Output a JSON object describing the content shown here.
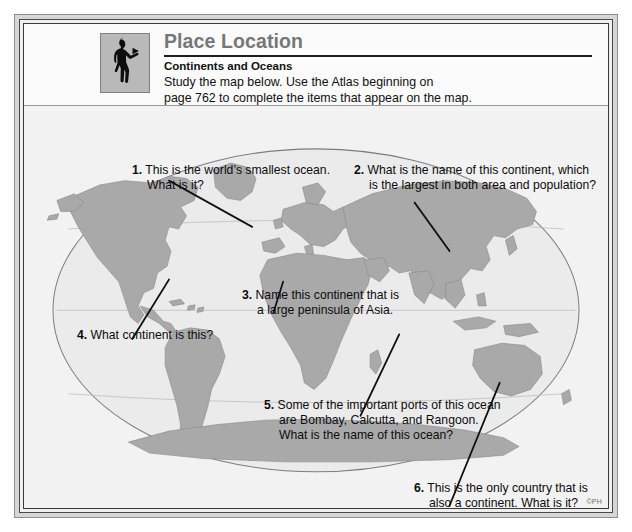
{
  "worksheet": {
    "icon_name": "person-looking-silhouette-icon",
    "title": "Place Location",
    "subtitle": "Continents and Oceans",
    "instructions": "Study the map below.  Use the Atlas beginning on\npage 762 to complete the items that appear on the map.",
    "copyright": "©PH"
  },
  "questions": [
    {
      "number": "1.",
      "text": "This is the world’s smallest ocean.\nWhat is it?"
    },
    {
      "number": "2.",
      "text": "What is the name of this continent, which\nis the largest in both area and population?"
    },
    {
      "number": "3.",
      "text": "Name this continent that is\na large peninsula of Asia."
    },
    {
      "number": "4.",
      "text": "What continent is this?"
    },
    {
      "number": "5.",
      "text": "Some of the important ports of this ocean\nare Bombay, Calcutta, and Rangoon.\nWhat is the name of this ocean?"
    },
    {
      "number": "6.",
      "text": "This is the only country that is\nalso a continent.  What is it?"
    }
  ],
  "map": {
    "name": "world-map-oval-projection",
    "land_color": "#a9a9a9",
    "ocean_color": "#ebebeb",
    "outline_color": "#6f6f6f",
    "leader_line_color": "#111111"
  },
  "colors": {
    "title_gray": "#777777",
    "rule_dark": "#1f1f1f",
    "frame_light": "#d6d6d6",
    "frame_dark": "#3a3a3a",
    "page_background": "#f2f2f2"
  }
}
